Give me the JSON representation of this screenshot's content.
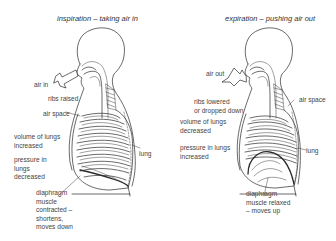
{
  "panels": [
    {
      "title": "inspiration – taking air in",
      "labels": {
        "air": "air in",
        "ribs": "ribs raised",
        "air_space": "air space",
        "volume": [
          "volume of lungs",
          "increased"
        ],
        "pressure": [
          "pressure in",
          "lungs",
          "decreased"
        ],
        "lung": "lung",
        "diaphragm": [
          "diaphragm",
          "muscle",
          "contracted –",
          "shortens,",
          "moves down"
        ]
      }
    },
    {
      "title": "expiration – pushing air out",
      "labels": {
        "air": "air out",
        "ribs": [
          "ribs lowered",
          "or dropped down"
        ],
        "air_space": "air space",
        "volume": [
          "volume of lungs",
          "decreased"
        ],
        "pressure": [
          "pressure in lungs",
          "increased"
        ],
        "lung": "lung",
        "diaphragm": [
          "diaphragm",
          "muscle relaxed",
          "– moves up"
        ]
      }
    }
  ],
  "colors": {
    "line": "#2a2a2a",
    "text": "#444444",
    "background": "#ffffff"
  }
}
